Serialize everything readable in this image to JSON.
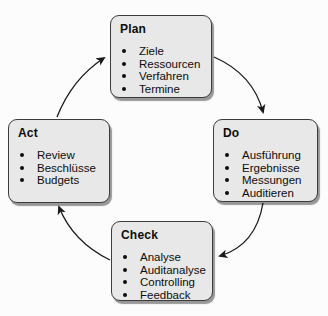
{
  "diagram": {
    "type": "cycle",
    "nodes": [
      {
        "id": "plan",
        "label": "Plan",
        "items": [
          "Ziele",
          "Ressourcen",
          "Verfahren",
          "Termine"
        ]
      },
      {
        "id": "do",
        "label": "Do",
        "items": [
          "Ausführung",
          "Ergebnisse",
          "Messungen",
          "Auditieren"
        ]
      },
      {
        "id": "check",
        "label": "Check",
        "items": [
          "Analyse",
          "Auditanalyse",
          "Controlling",
          "Feedback"
        ]
      },
      {
        "id": "act",
        "label": "Act",
        "items": [
          "Review",
          "Beschlüsse",
          "Budgets"
        ]
      }
    ],
    "edges": [
      [
        "act",
        "plan"
      ],
      [
        "plan",
        "do"
      ],
      [
        "do",
        "check"
      ],
      [
        "check",
        "act"
      ]
    ],
    "colors": {
      "background": "#fcfcfc",
      "box_fill": "#e8e8e8",
      "box_border": "#3c3c3c",
      "arrow": "#1a1a1a",
      "text": "#0d0d0d"
    }
  }
}
